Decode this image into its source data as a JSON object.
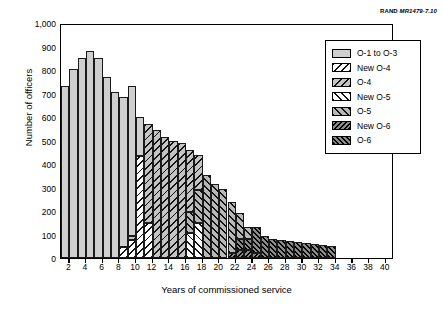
{
  "credit": {
    "org": "RAND",
    "report_id": "MR1479-7.10"
  },
  "axes": {
    "y_title": "Number of officers",
    "x_title": "Years of commissioned service",
    "y_ticks": [
      "0",
      "100",
      "200",
      "300",
      "400",
      "500",
      "600",
      "700",
      "800",
      "900",
      "1,000"
    ],
    "x_ticks": [
      "2",
      "4",
      "6",
      "8",
      "10",
      "12",
      "14",
      "16",
      "18",
      "20",
      "22",
      "24",
      "26",
      "28",
      "30",
      "32",
      "34",
      "36",
      "38",
      "40"
    ]
  },
  "legend": {
    "items": [
      {
        "label": "O-1 to O-3",
        "key": "o1_to_o3",
        "pattern": "solid-light-gray",
        "color": "#cfcfcf"
      },
      {
        "label": "New O-4",
        "key": "new_o4",
        "pattern": "white-backslash-hatch",
        "color": "#ffffff"
      },
      {
        "label": "O-4",
        "key": "o4",
        "pattern": "gray-backslash-hatch",
        "color": "#c4c4c4"
      },
      {
        "label": "New O-5",
        "key": "new_o5",
        "pattern": "white-forwardslash-hatch",
        "color": "#ffffff"
      },
      {
        "label": "O-5",
        "key": "o5",
        "pattern": "gray-forwardslash-hatch",
        "color": "#b8b8b8"
      },
      {
        "label": "New O-6",
        "key": "new_o6",
        "pattern": "dark-dense-backslash-hatch",
        "color": "#8a8a8a"
      },
      {
        "label": "O-6",
        "key": "o6",
        "pattern": "dark-dense-forwardslash-hatch",
        "color": "#8a8a8a"
      }
    ]
  },
  "chart_data": {
    "type": "bar",
    "subtype": "stacked-histogram",
    "title": "",
    "xlabel": "Years of commissioned service",
    "ylabel": "Number of officers",
    "xlim": [
      1,
      41
    ],
    "ylim": [
      0,
      1000
    ],
    "ytick_step": 100,
    "xtick_step": 2,
    "grid": false,
    "legend_position": "top-right-inside",
    "categories": [
      1,
      2,
      3,
      4,
      5,
      6,
      7,
      8,
      9,
      10,
      11,
      12,
      13,
      14,
      15,
      16,
      17,
      18,
      19,
      20,
      21,
      22,
      23,
      24,
      25,
      26,
      27,
      28,
      29,
      30,
      31,
      32,
      33
    ],
    "series": [
      {
        "name": "O-1 to O-3",
        "key": "o1_to_o3",
        "values": [
          730,
          803,
          853,
          882,
          850,
          772,
          708,
          640,
          635,
          165,
          0,
          0,
          0,
          0,
          0,
          0,
          0,
          0,
          0,
          0,
          0,
          0,
          0,
          0,
          0,
          0,
          0,
          0,
          0,
          0,
          0,
          0,
          0
        ]
      },
      {
        "name": "New O-4",
        "key": "new_o4",
        "values": [
          0,
          0,
          0,
          0,
          0,
          0,
          0,
          45,
          75,
          435,
          150,
          0,
          0,
          0,
          0,
          0,
          0,
          0,
          0,
          0,
          0,
          0,
          0,
          0,
          0,
          0,
          0,
          0,
          0,
          0,
          0,
          0,
          0
        ]
      },
      {
        "name": "O-4",
        "key": "o4",
        "values": [
          0,
          0,
          0,
          0,
          0,
          0,
          0,
          0,
          20,
          0,
          420,
          545,
          515,
          500,
          490,
          265,
          150,
          0,
          0,
          0,
          0,
          0,
          0,
          0,
          0,
          0,
          0,
          0,
          0,
          0,
          0,
          0,
          0
        ]
      },
      {
        "name": "New O-5",
        "key": "new_o5",
        "values": [
          0,
          0,
          0,
          0,
          0,
          0,
          0,
          0,
          0,
          0,
          0,
          0,
          0,
          0,
          0,
          105,
          150,
          0,
          0,
          0,
          0,
          0,
          0,
          0,
          0,
          0,
          0,
          0,
          0,
          0,
          0,
          0,
          0
        ]
      },
      {
        "name": "O-5",
        "key": "o5",
        "values": [
          0,
          0,
          0,
          0,
          0,
          0,
          0,
          0,
          0,
          0,
          0,
          0,
          0,
          0,
          0,
          90,
          140,
          355,
          315,
          293,
          220,
          110,
          50,
          0,
          0,
          0,
          0,
          0,
          0,
          0,
          0,
          0,
          0
        ]
      },
      {
        "name": "New O-6",
        "key": "new_o6",
        "values": [
          0,
          0,
          0,
          0,
          0,
          0,
          0,
          0,
          0,
          0,
          0,
          0,
          0,
          0,
          0,
          0,
          0,
          0,
          0,
          0,
          20,
          35,
          35,
          20,
          0,
          0,
          0,
          0,
          0,
          0,
          0,
          0,
          0
        ]
      },
      {
        "name": "O-6",
        "key": "o6",
        "values": [
          0,
          0,
          0,
          0,
          0,
          0,
          0,
          0,
          0,
          0,
          0,
          0,
          0,
          0,
          0,
          0,
          0,
          0,
          0,
          0,
          0,
          45,
          45,
          110,
          93,
          80,
          78,
          72,
          68,
          65,
          60,
          55,
          50
        ]
      }
    ],
    "totals": [
      730,
      803,
      853,
      882,
      850,
      772,
      708,
      685,
      730,
      600,
      570,
      545,
      515,
      500,
      490,
      460,
      440,
      355,
      315,
      293,
      240,
      190,
      130,
      130,
      93,
      80,
      78,
      72,
      68,
      65,
      60,
      55,
      50
    ]
  }
}
